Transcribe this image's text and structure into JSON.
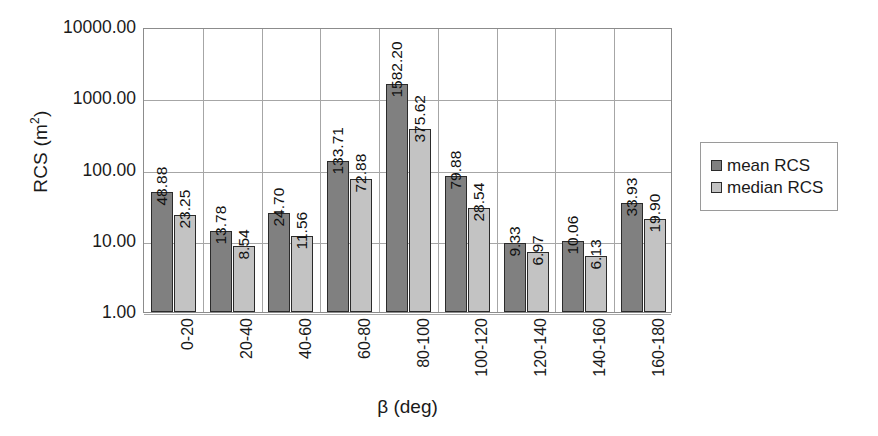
{
  "chart_data": {
    "type": "bar",
    "title": "",
    "xlabel": "β (deg)",
    "ylabel": "RCS (m²)",
    "ylabel_base": "RCS (m",
    "ylabel_sup": "2",
    "ylabel_tail": ")",
    "yscale": "log",
    "ylim": [
      1,
      10000
    ],
    "grid": true,
    "legend_position": "right",
    "categories": [
      "0-20",
      "20-40",
      "40-60",
      "60-80",
      "80-100",
      "100-120",
      "120-140",
      "140-160",
      "160-180"
    ],
    "ytick_labels": [
      "10000.00",
      "1000.00",
      "100.00",
      "10.00",
      "1.00"
    ],
    "ytick_values": [
      10000,
      1000,
      100,
      10,
      1
    ],
    "series": [
      {
        "name": "mean RCS",
        "color": "#808080",
        "values": [
          48.88,
          13.78,
          24.7,
          133.71,
          1582.2,
          79.88,
          9.33,
          10.06,
          33.93
        ],
        "labels": [
          "48.88",
          "13.78",
          "24.70",
          "133.71",
          "1582.20",
          "79.88",
          "9.33",
          "10.06",
          "33.93"
        ]
      },
      {
        "name": "median RCS",
        "color": "#c3c3c3",
        "values": [
          23.25,
          8.54,
          11.56,
          72.88,
          375.62,
          28.54,
          6.97,
          6.13,
          19.9
        ],
        "labels": [
          "23.25",
          "8.54",
          "11.56",
          "72.88",
          "375.62",
          "28.54",
          "6.97",
          "6.13",
          "19.90"
        ]
      }
    ]
  },
  "legend": {
    "items": [
      {
        "label": "mean RCS",
        "color": "#808080"
      },
      {
        "label": "median RCS",
        "color": "#c3c3c3"
      }
    ]
  },
  "colors": {
    "mean": "#808080",
    "median": "#c3c3c3",
    "grid": "#a6a6a6",
    "axis": "#8c8c8c",
    "text": "#1a1a1a",
    "background": "#ffffff"
  }
}
